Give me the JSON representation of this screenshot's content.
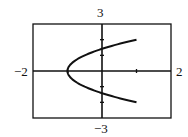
{
  "labels": {
    "ymax": "3",
    "ymin": "−3",
    "xmin": "−2",
    "xmax": "2"
  },
  "colors": {
    "line": "#111111",
    "frame": "#111111",
    "background": "#ffffff"
  },
  "chart_data": {
    "type": "line",
    "title": "",
    "xlabel": "",
    "ylabel": "",
    "xlim": [
      -2,
      2
    ],
    "ylim": [
      -3,
      3
    ],
    "x_ticks": [
      -1,
      1
    ],
    "y_ticks": [
      -2,
      -1,
      1,
      2
    ],
    "grid": false,
    "legend": null,
    "series": [
      {
        "name": "x = y^2/2 - 1",
        "points": [
          [
            1.0,
            2.0
          ],
          [
            0.62,
            1.75
          ],
          [
            0.28,
            1.5
          ],
          [
            0.0,
            1.41
          ],
          [
            -0.22,
            1.25
          ],
          [
            -0.5,
            1.0
          ],
          [
            -0.72,
            0.75
          ],
          [
            -0.88,
            0.5
          ],
          [
            -0.97,
            0.25
          ],
          [
            -1.0,
            0.0
          ],
          [
            -0.97,
            -0.25
          ],
          [
            -0.88,
            -0.5
          ],
          [
            -0.72,
            -0.75
          ],
          [
            -0.5,
            -1.0
          ],
          [
            -0.22,
            -1.25
          ],
          [
            0.0,
            -1.41
          ],
          [
            0.28,
            -1.5
          ],
          [
            0.62,
            -1.75
          ],
          [
            1.0,
            -2.0
          ]
        ]
      }
    ]
  }
}
